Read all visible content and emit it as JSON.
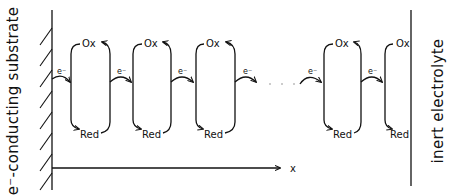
{
  "diagram": {
    "left_label": "e⁻-conducting substrate",
    "right_label": "inert electrolyte",
    "axis_label": "x",
    "ox_label": "Ox",
    "red_label": "Red",
    "electron_label": "e⁻",
    "continuation": "· · ·",
    "loops": [
      {
        "ox": "Ox",
        "red": "Red",
        "electron": "e⁻"
      },
      {
        "ox": "Ox",
        "red": "Red",
        "electron": "e⁻"
      },
      {
        "ox": "Ox",
        "red": "Red",
        "electron": "e⁻"
      },
      {
        "ox": "Ox",
        "red": "Red",
        "electron": "e⁻"
      },
      {
        "ox": "Ox",
        "red": "Red",
        "electron": "e⁻"
      }
    ]
  }
}
